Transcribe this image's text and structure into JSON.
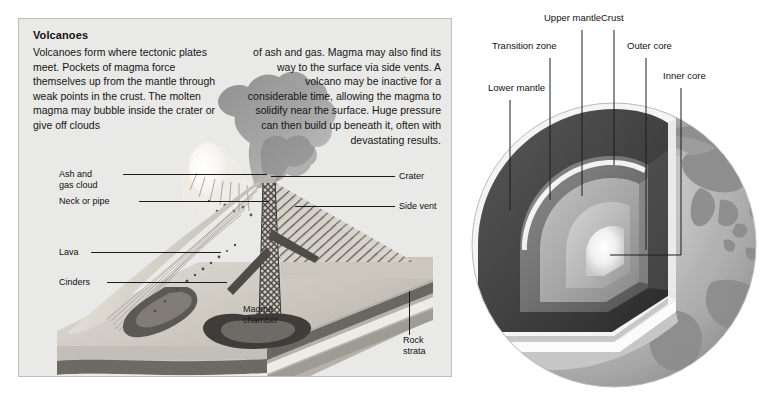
{
  "page": {
    "width": 767,
    "height": 400,
    "background": "#ffffff"
  },
  "volcano_panel": {
    "title": "Volcanoes",
    "background": "#e9e9e7",
    "border_color": "#bdbdbd",
    "body_left": "Volcanoes form where tectonic plates meet. Pockets of magma force themselves up from the mantle through weak points in the crust. The molten magma may bubble inside the crater or give off clouds",
    "body_right": "of ash and gas. Magma may also find its way to the surface via side vents. A volcano may be inactive for a considerable time, allowing the magma to solidify near the surface. Huge pressure can then build up beneath it, often with devastating results.",
    "labels": {
      "ash_and_gas_cloud": "Ash and\ngas cloud",
      "neck_or_pipe": "Neck or pipe",
      "lava": "Lava",
      "cinders": "Cinders",
      "magma_chamber": "Magma\nchamber",
      "crater": "Crater",
      "side_vent": "Side vent",
      "rock_strata": "Rock\nstrata"
    }
  },
  "earth_diagram": {
    "labels": {
      "lower_mantle": "Lower mantle",
      "transition_zone": "Transition zone",
      "upper_mantle": "Upper mantle",
      "crust": "Crust",
      "outer_core": "Outer core",
      "inner_core": "Inner core"
    },
    "credit": "",
    "colors": {
      "globe_light": "#c9c9c9",
      "globe_mid": "#a8a8a8",
      "continent": "#8f8f8f",
      "lower_mantle": "#4a4a4a",
      "transition_zone": "#6f6f6f",
      "upper_mantle": "#a3a3a3",
      "crust": "#f2f2f2",
      "outer_core": "#b9b9b9",
      "inner_core": "#fbfbfb"
    }
  }
}
